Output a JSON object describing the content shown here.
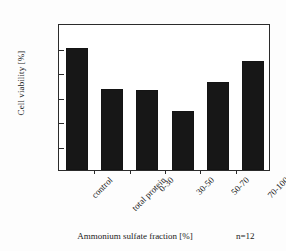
{
  "chart_data": {
    "type": "bar",
    "title": "",
    "xlabel": "Ammonium sulfate fraction  [%]",
    "ylabel": "Cell viability [%]",
    "categories": [
      "control",
      "total protein",
      "0-30",
      "30-50",
      "50-70",
      "70-100"
    ],
    "values": [
      100,
      66,
      65,
      48,
      72,
      89
    ],
    "ylim": [
      0,
      120
    ],
    "yticks": [
      0,
      20,
      40,
      60,
      80,
      100,
      120
    ],
    "ytick_labels": [
      "0",
      "20",
      "40",
      "60",
      "80",
      "100",
      "120"
    ],
    "grid": false,
    "legend": "none",
    "bar_color": "#171717",
    "annotation": "n=12",
    "xtick_label_rotation": -45
  }
}
